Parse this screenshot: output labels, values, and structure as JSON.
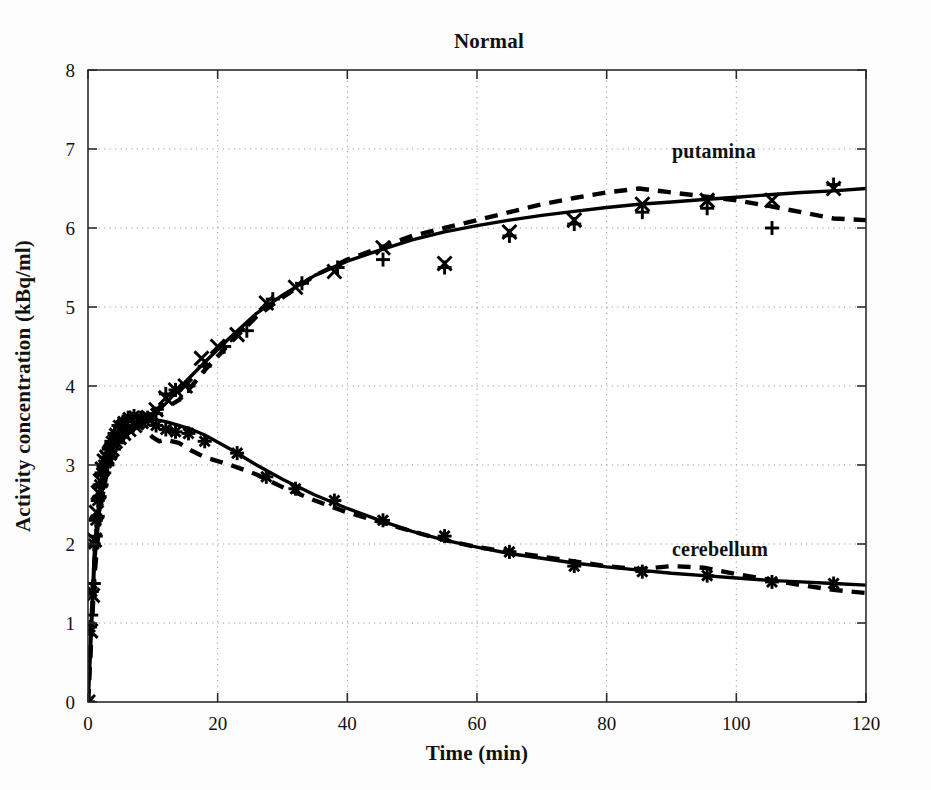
{
  "chart_data": {
    "type": "line",
    "title": "Normal",
    "xlabel": "Time (min)",
    "ylabel": "Activity concentration (kBq/ml)",
    "xlim": [
      0,
      120
    ],
    "ylim": [
      0,
      8
    ],
    "xticks": [
      0,
      20,
      40,
      60,
      80,
      100,
      120
    ],
    "yticks": [
      0,
      1,
      2,
      3,
      4,
      5,
      6,
      7,
      8
    ],
    "grid": true,
    "legend_position": "inline-annotations",
    "annotations": [
      {
        "text": "putamina",
        "x": 86,
        "y": 7.0
      },
      {
        "text": "cerebellum",
        "x": 86,
        "y": 2.05
      }
    ],
    "series": [
      {
        "name": "putamina measured (x)",
        "marker": "x",
        "linestyle": "none",
        "x": [
          0.0,
          0.4,
          0.7,
          1.0,
          1.3,
          1.6,
          1.9,
          2.2,
          2.5,
          2.9,
          3.3,
          3.7,
          4.2,
          4.8,
          5.5,
          6.3,
          7.2,
          8.2,
          9.3,
          10.5,
          12.0,
          13.5,
          15.0,
          17.5,
          20.0,
          23.0,
          27.5,
          32.0,
          38.0,
          45.5,
          55.0,
          65.0,
          75.0,
          85.5,
          95.5,
          105.5,
          115.0
        ],
        "y": [
          0.0,
          0.9,
          1.35,
          2.05,
          2.4,
          2.65,
          2.8,
          2.95,
          3.05,
          3.1,
          3.15,
          3.2,
          3.3,
          3.35,
          3.4,
          3.45,
          3.5,
          3.55,
          3.6,
          3.7,
          3.85,
          3.95,
          4.0,
          4.35,
          4.5,
          4.65,
          5.05,
          5.25,
          5.45,
          5.75,
          5.55,
          5.95,
          6.1,
          6.3,
          6.35,
          6.35,
          6.5
        ]
      },
      {
        "name": "putamina measured (+)",
        "marker": "plus",
        "linestyle": "none",
        "x": [
          0.0,
          0.5,
          0.9,
          1.2,
          1.5,
          1.8,
          2.1,
          2.5,
          3.0,
          3.5,
          4.0,
          4.6,
          5.3,
          6.1,
          7.0,
          8.0,
          9.2,
          10.5,
          12.0,
          13.5,
          15.5,
          18.0,
          21.0,
          24.5,
          28.5,
          33.0,
          38.5,
          45.5,
          55.0,
          65.0,
          75.0,
          85.5,
          95.5,
          105.5,
          115.0
        ],
        "y": [
          0.0,
          1.1,
          1.5,
          2.1,
          2.35,
          2.6,
          2.75,
          2.9,
          3.0,
          3.1,
          3.2,
          3.3,
          3.35,
          3.45,
          3.5,
          3.55,
          3.6,
          3.65,
          3.9,
          3.95,
          4.0,
          4.25,
          4.5,
          4.7,
          5.1,
          5.3,
          5.5,
          5.6,
          5.5,
          5.9,
          6.05,
          6.2,
          6.25,
          6.0,
          6.55
        ]
      },
      {
        "name": "putamina model fit (solid)",
        "marker": "none",
        "linestyle": "solid",
        "x": [
          0,
          1,
          2,
          3,
          4,
          5,
          6,
          8,
          10,
          12,
          15,
          18,
          22,
          26,
          30,
          35,
          40,
          45,
          50,
          55,
          60,
          65,
          70,
          75,
          80,
          85,
          90,
          95,
          100,
          105,
          110,
          115,
          120
        ],
        "y": [
          0.0,
          1.75,
          2.6,
          3.0,
          3.2,
          3.3,
          3.38,
          3.5,
          3.62,
          3.78,
          4.05,
          4.3,
          4.62,
          4.92,
          5.15,
          5.4,
          5.58,
          5.72,
          5.85,
          5.95,
          6.03,
          6.1,
          6.16,
          6.21,
          6.26,
          6.3,
          6.33,
          6.36,
          6.39,
          6.42,
          6.45,
          6.47,
          6.5
        ]
      },
      {
        "name": "putamina model fit (dashed)",
        "marker": "none",
        "linestyle": "dashed",
        "x": [
          0,
          1,
          2,
          3,
          4,
          5,
          6,
          8,
          10,
          12,
          14,
          16,
          18,
          22,
          26,
          30,
          35,
          40,
          45,
          50,
          55,
          60,
          65,
          70,
          75,
          80,
          85,
          90,
          95,
          100,
          105,
          110,
          115,
          120
        ],
        "y": [
          0.0,
          1.6,
          2.5,
          2.95,
          3.15,
          3.28,
          3.4,
          3.55,
          3.7,
          3.72,
          3.82,
          4.0,
          4.2,
          4.55,
          4.88,
          5.12,
          5.4,
          5.6,
          5.75,
          5.9,
          6.0,
          6.1,
          6.2,
          6.3,
          6.38,
          6.45,
          6.5,
          6.45,
          6.4,
          6.35,
          6.28,
          6.2,
          6.12,
          6.1
        ]
      },
      {
        "name": "cerebellum measured (*)",
        "marker": "asterisk",
        "linestyle": "none",
        "x": [
          0.0,
          0.3,
          0.6,
          0.9,
          1.2,
          1.5,
          1.8,
          2.1,
          2.4,
          2.8,
          3.2,
          3.6,
          4.1,
          4.7,
          5.4,
          6.2,
          7.1,
          8.1,
          9.3,
          10.5,
          12.0,
          13.5,
          15.5,
          18.0,
          23.0,
          27.5,
          32.0,
          38.0,
          45.5,
          55.0,
          65.0,
          75.0,
          85.5,
          95.5,
          105.5,
          115.0
        ],
        "y": [
          0.0,
          0.95,
          1.4,
          2.0,
          2.3,
          2.55,
          2.75,
          2.9,
          3.0,
          3.1,
          3.2,
          3.3,
          3.4,
          3.5,
          3.55,
          3.6,
          3.62,
          3.6,
          3.58,
          3.5,
          3.45,
          3.42,
          3.4,
          3.3,
          3.15,
          2.85,
          2.7,
          2.55,
          2.3,
          2.1,
          1.9,
          1.72,
          1.65,
          1.6,
          1.52,
          1.5
        ]
      },
      {
        "name": "cerebellum model fit (solid)",
        "marker": "none",
        "linestyle": "solid",
        "x": [
          0,
          1,
          2,
          3,
          4,
          5,
          6,
          8,
          10,
          12,
          14,
          16,
          18,
          22,
          26,
          30,
          35,
          40,
          45,
          50,
          55,
          60,
          65,
          70,
          75,
          80,
          85,
          90,
          95,
          100,
          105,
          110,
          115,
          120
        ],
        "y": [
          0.0,
          1.95,
          2.8,
          3.15,
          3.3,
          3.4,
          3.48,
          3.55,
          3.58,
          3.55,
          3.5,
          3.45,
          3.38,
          3.2,
          3.0,
          2.82,
          2.62,
          2.45,
          2.3,
          2.16,
          2.05,
          1.96,
          1.88,
          1.82,
          1.76,
          1.71,
          1.67,
          1.63,
          1.6,
          1.57,
          1.54,
          1.52,
          1.5,
          1.48
        ]
      },
      {
        "name": "cerebellum model fit (dashed)",
        "marker": "none",
        "linestyle": "dashed",
        "x": [
          0,
          1,
          2,
          3,
          4,
          5,
          6,
          8,
          10,
          11,
          12,
          14,
          16,
          18,
          22,
          26,
          30,
          35,
          40,
          45,
          50,
          55,
          60,
          65,
          70,
          75,
          80,
          85,
          90,
          95,
          100,
          105,
          110,
          115,
          120
        ],
        "y": [
          0.0,
          1.8,
          2.7,
          3.05,
          3.25,
          3.38,
          3.45,
          3.5,
          3.35,
          3.3,
          3.32,
          3.28,
          3.18,
          3.1,
          3.0,
          2.88,
          2.72,
          2.55,
          2.4,
          2.28,
          2.16,
          2.05,
          1.96,
          1.9,
          1.84,
          1.78,
          1.72,
          1.68,
          1.72,
          1.7,
          1.62,
          1.55,
          1.48,
          1.42,
          1.38
        ]
      }
    ]
  },
  "figure": {
    "background_color": "#fdfdfd",
    "axis_color": "#2b2b2b",
    "grid_color": "#9a9a9a",
    "series_color": "#000000"
  }
}
